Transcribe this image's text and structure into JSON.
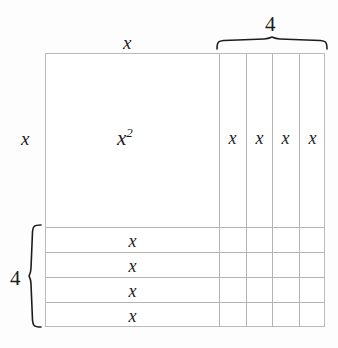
{
  "figure": {
    "type": "area-model-diagram"
  },
  "labels": {
    "top_side": "x",
    "left_side": "x",
    "big_square": "x",
    "big_square_exponent": "2",
    "top_brace_value": "4",
    "left_brace_value": "4"
  },
  "columns": [
    {
      "label": "x"
    },
    {
      "label": "x"
    },
    {
      "label": "x"
    },
    {
      "label": "x"
    }
  ],
  "rows": [
    {
      "label": "x"
    },
    {
      "label": "x"
    },
    {
      "label": "x"
    },
    {
      "label": "x"
    }
  ],
  "colors": {
    "background": "#fdfdfd",
    "unshaded_fill": "#ffffff",
    "light_shade": "#eff0ef",
    "dark_shade": "#e7e8e7",
    "grid_line": "#b2b4b4",
    "outline": "#b9bbbb",
    "text": "#1c1c1c"
  }
}
